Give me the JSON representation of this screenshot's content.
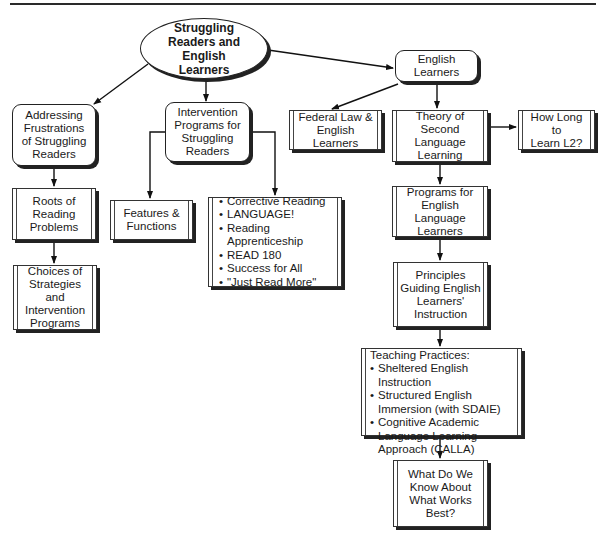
{
  "diagram": {
    "root": {
      "label": "Struggling\nReaders and English\nLearners"
    },
    "english_learners": {
      "label": "English\nLearners"
    },
    "addressing": {
      "label": "Addressing\nFrustrations\nof Struggling\nReaders"
    },
    "intervention": {
      "label": "Intervention\nPrograms for\nStruggling\nReaders"
    },
    "federal_law": {
      "label": "Federal Law &\nEnglish  Learners"
    },
    "theory": {
      "label": "Theory of Second\nLanguage\nLearning"
    },
    "how_long": {
      "label": "How Long to\nLearn L2?"
    },
    "roots": {
      "label": "Roots of\nReading\nProblems"
    },
    "features": {
      "label": "Features &\nFunctions"
    },
    "programs_list": {
      "items": [
        "Corrective Reading",
        "LANGUAGE!",
        "Reading Apprenticeship",
        "READ 180",
        "Success for All",
        "\"Just Read More\""
      ]
    },
    "choices": {
      "label": "Choices of\nStrategies and\nIntervention\nPrograms"
    },
    "programs_ell": {
      "label": "Programs for\nEnglish Language\nLearners"
    },
    "principles": {
      "label": "Principles\nGuiding English\nLearners'\nInstruction"
    },
    "teaching": {
      "heading": "Teaching Practices:",
      "items": [
        "Sheltered English Instruction",
        "Structured English Immersion (with SDAIE)",
        "Cognitive Academic Language Learning Approach (CALLA)"
      ]
    },
    "what_works": {
      "label": "What Do We\nKnow About\nWhat Works\nBest?"
    }
  }
}
